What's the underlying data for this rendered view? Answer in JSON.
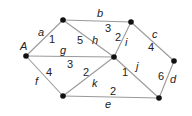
{
  "diagram": {
    "type": "weighted-graph",
    "nodes": [
      {
        "id": "A",
        "label": "A",
        "x": 26,
        "y": 56
      },
      {
        "id": "TL",
        "label": "",
        "x": 63,
        "y": 20
      },
      {
        "id": "TR",
        "label": "",
        "x": 131,
        "y": 22
      },
      {
        "id": "C",
        "label": "",
        "x": 114,
        "y": 57
      },
      {
        "id": "R",
        "label": "",
        "x": 174,
        "y": 61
      },
      {
        "id": "BL",
        "label": "",
        "x": 63,
        "y": 96
      },
      {
        "id": "BR",
        "label": "",
        "x": 159,
        "y": 98
      }
    ],
    "edges": [
      {
        "name": "a",
        "weight": "1",
        "from": "A",
        "to": "TL"
      },
      {
        "name": "b",
        "weight": "3",
        "from": "TL",
        "to": "TR"
      },
      {
        "name": "c",
        "weight": "4",
        "from": "TR",
        "to": "R"
      },
      {
        "name": "d",
        "weight": "6",
        "from": "R",
        "to": "BR"
      },
      {
        "name": "e",
        "weight": "2",
        "from": "BL",
        "to": "BR"
      },
      {
        "name": "f",
        "weight": "4",
        "from": "A",
        "to": "BL"
      },
      {
        "name": "g",
        "weight": "3",
        "from": "A",
        "to": "C"
      },
      {
        "name": "h",
        "weight": "5",
        "from": "TL",
        "to": "C"
      },
      {
        "name": "i",
        "weight": "2",
        "from": "C",
        "to": "TR"
      },
      {
        "name": "j",
        "weight": "1",
        "from": "C",
        "to": "BR"
      },
      {
        "name": "k",
        "weight": "2",
        "from": "BL",
        "to": "C"
      }
    ],
    "labels": {
      "A": "A",
      "a": "a",
      "a_w": "1",
      "b": "b",
      "b_w": "3",
      "c": "c",
      "c_w": "4",
      "d": "d",
      "d_w": "6",
      "e": "e",
      "e_w": "2",
      "f": "f",
      "f_w": "4",
      "g": "g",
      "g_w": "3",
      "h": "h",
      "h_w": "5",
      "i": "i",
      "i_w": "2",
      "j": "j",
      "j_w": "1",
      "k": "k",
      "k_w": "2"
    }
  }
}
